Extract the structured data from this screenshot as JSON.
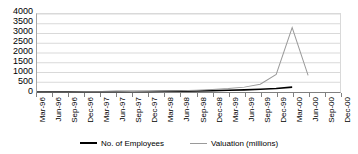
{
  "chart_data": {
    "type": "line",
    "title": "",
    "subtitle": "",
    "xlabel": "",
    "ylabel": "",
    "ylim": [
      0,
      4000
    ],
    "ytick_step": 500,
    "yticks": [
      4000,
      3500,
      3000,
      2500,
      2000,
      1500,
      1000,
      500,
      0
    ],
    "grid": true,
    "legend_position": "bottom",
    "categories": [
      "Mar-96",
      "Jun-96",
      "Sep-96",
      "Dec-96",
      "Mar-97",
      "Jun-97",
      "Sep-97",
      "Dec-97",
      "Mar-98",
      "Jun-98",
      "Sep-98",
      "Dec-98",
      "Mar-99",
      "Jun-99",
      "Sep-99",
      "Dec-99",
      "Mar-00",
      "Jun-00",
      "Sep-00",
      "Dec-00"
    ],
    "series": [
      {
        "name": "No. of Employees",
        "color": "#000000",
        "values": [
          5,
          6,
          8,
          10,
          14,
          18,
          22,
          28,
          35,
          45,
          55,
          70,
          90,
          110,
          140,
          180,
          250,
          null,
          null,
          null
        ]
      },
      {
        "name": "Valuation (millions)",
        "color": "#9a9a9a",
        "values": [
          2,
          3,
          5,
          8,
          12,
          18,
          25,
          35,
          50,
          70,
          95,
          130,
          180,
          250,
          400,
          900,
          3300,
          850,
          null,
          null
        ]
      }
    ]
  },
  "legend": {
    "items": [
      {
        "label": "No. of Employees",
        "color": "#000000"
      },
      {
        "label": "Valuation (millions)",
        "color": "#9a9a9a"
      }
    ]
  }
}
